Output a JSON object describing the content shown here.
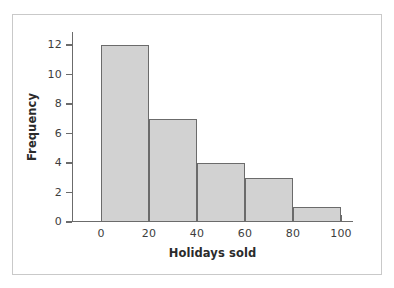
{
  "figure": {
    "frame_border_color": "#c9c9c9",
    "background_color": "#ffffff"
  },
  "chart_data": {
    "type": "bar",
    "title": "",
    "subtitle": "",
    "xlabel": "Holidays sold",
    "ylabel": "Frequency",
    "categories": [
      "0–20",
      "20–40",
      "40–60",
      "60–80",
      "80–100"
    ],
    "bin_edges": [
      0,
      20,
      40,
      60,
      80,
      100
    ],
    "values": [
      12,
      7,
      4,
      3,
      1
    ],
    "xlim": [
      0,
      100
    ],
    "ylim": [
      0,
      12
    ],
    "xticks": [
      0,
      20,
      40,
      60,
      80,
      100
    ],
    "xtick_labels": [
      "0",
      "20",
      "40",
      "60",
      "80",
      "100"
    ],
    "yticks": [
      0,
      2,
      4,
      6,
      8,
      10,
      12
    ],
    "ytick_labels": [
      "0",
      "2",
      "4",
      "6",
      "8",
      "10",
      "12"
    ],
    "grid": false,
    "legend": null,
    "bar_fill_color": "#d2d2d2",
    "bar_edge_color": "#6b6b6b",
    "axis_color": "#6b6b6b",
    "text_color": "#3d3d3d"
  }
}
